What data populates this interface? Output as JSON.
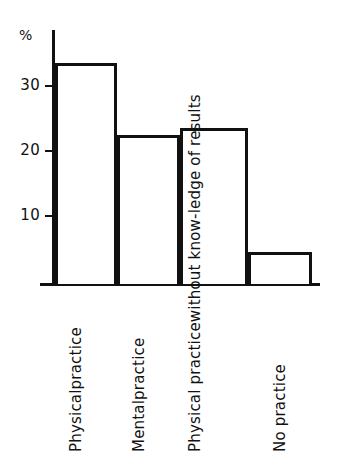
{
  "chart": {
    "type": "bar",
    "unit_label": "%",
    "y_ticks": [
      {
        "label": "10",
        "value": 10
      },
      {
        "label": "20",
        "value": 20
      },
      {
        "label": "30",
        "value": 30
      }
    ],
    "bars": [
      {
        "value": 34,
        "label_lines": [
          "Physical",
          "practice"
        ],
        "label_text": "Physical practice"
      },
      {
        "value": 23,
        "label_lines": [
          "Mental",
          "practice"
        ],
        "label_text": "Mental practice"
      },
      {
        "value": 24,
        "label_lines": [
          "Physical practice",
          "without know-",
          "ledge of results"
        ],
        "label_text": "Physical practice without knowledge of results"
      },
      {
        "value": 5,
        "label_lines": [
          "No practice"
        ],
        "label_text": "No practice"
      }
    ]
  },
  "chart_data": {
    "type": "bar",
    "title": "",
    "subtitle": "",
    "xlabel": "",
    "ylabel": "%",
    "categories": [
      "Physical practice",
      "Mental practice",
      "Physical practice without knowledge of results",
      "No practice"
    ],
    "values": [
      34,
      23,
      24,
      5
    ],
    "ylim": [
      0,
      36
    ],
    "ytick_values": [
      10,
      20,
      30
    ],
    "ytick_labels": [
      "10",
      "20",
      "30"
    ],
    "grid": false,
    "legend": null,
    "bar_style": "outlined white fill, black border",
    "annotations": []
  }
}
